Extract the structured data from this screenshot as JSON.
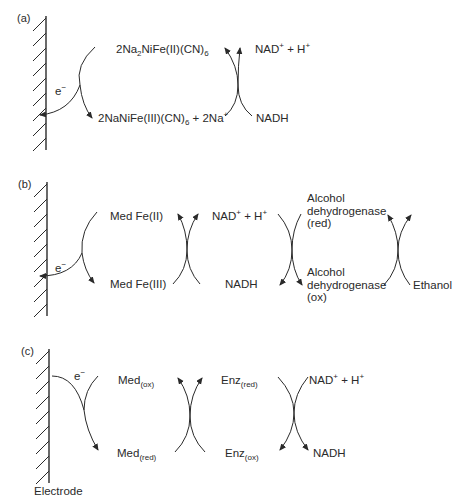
{
  "figure": {
    "panels": [
      {
        "id": "a",
        "label": "(a)",
        "electron": "e",
        "electron_sup": "−",
        "species": [
          {
            "parts": [
              "2Na",
              "2",
              "NiFe(II)(CN)",
              "6"
            ]
          },
          {
            "parts": [
              "2NaNiFe(III)(CN)",
              "6",
              " + 2Na",
              "+"
            ]
          },
          {
            "parts": [
              "NAD",
              "+",
              " + H",
              "+"
            ]
          },
          {
            "parts": [
              "NADH"
            ]
          }
        ]
      },
      {
        "id": "b",
        "label": "(b)",
        "electron": "e",
        "electron_sup": "−",
        "species": [
          {
            "text": "Med Fe(II)"
          },
          {
            "text": "Med Fe(III)"
          },
          {
            "parts": [
              "NAD",
              "+",
              " + H",
              "+"
            ]
          },
          {
            "text": "NADH"
          },
          {
            "lines": [
              "Alcohol",
              "dehydrogenase",
              "(red)"
            ]
          },
          {
            "lines": [
              "Alcohol",
              "dehydrogenase",
              "(ox)"
            ]
          },
          {
            "text": "Ethanol"
          }
        ]
      },
      {
        "id": "c",
        "label": "(c)",
        "electron": "e",
        "electron_sup": "−",
        "species": [
          {
            "base": "Med",
            "sub": "(ox)"
          },
          {
            "base": "Med",
            "sub": "(red)"
          },
          {
            "base": "Enz",
            "sub": "(red)"
          },
          {
            "base": "Enz",
            "sub": "(ox)"
          },
          {
            "parts": [
              "NAD",
              "+",
              " + H",
              "+"
            ]
          },
          {
            "text": "NADH"
          }
        ],
        "electrode_label": "Electrode"
      }
    ],
    "colors": {
      "ink": "#2a2a2a",
      "background": "#ffffff"
    }
  }
}
